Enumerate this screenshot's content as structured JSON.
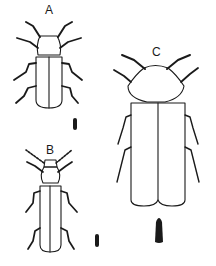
{
  "figure": {
    "specimens": [
      {
        "id": "A",
        "label": "A"
      },
      {
        "id": "B",
        "label": "B"
      },
      {
        "id": "C",
        "label": "C"
      }
    ],
    "colors": {
      "ink": "#1a1a1a",
      "background": "#ffffff"
    }
  }
}
